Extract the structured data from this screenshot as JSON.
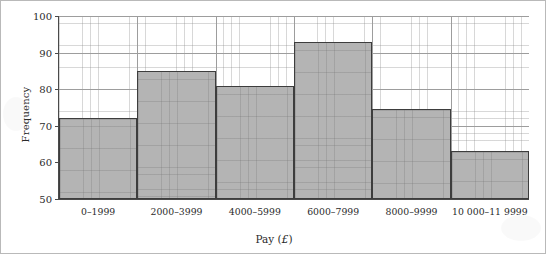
{
  "chart_data": {
    "type": "bar",
    "title": "",
    "xlabel": "Pay (£)",
    "ylabel": "Frequency",
    "categories": [
      "0–1999",
      "2000–3999",
      "4000–5999",
      "6000–7999",
      "8000–9999",
      "10 000–11 9999"
    ],
    "values": [
      72,
      85,
      81,
      93,
      74.5,
      63
    ],
    "ylim": [
      50,
      100
    ],
    "yticks": [
      50,
      60,
      70,
      80,
      90,
      100
    ],
    "ytick_labels": [
      "50",
      "60",
      "70",
      "80",
      "90",
      "100"
    ],
    "grid": true,
    "grid_minor": true,
    "legend": false,
    "bar_fill_color": "#b4b4b4",
    "bar_edge_color": "#3d3d3d",
    "axis_color": "#4a4a4a",
    "gridline_color": "#9d9d9d",
    "background_color": "#ffffff"
  },
  "axis_titles": {
    "x_prefix": "Pay (",
    "x_currency": "£",
    "x_suffix": ")",
    "y": "Frequency"
  }
}
